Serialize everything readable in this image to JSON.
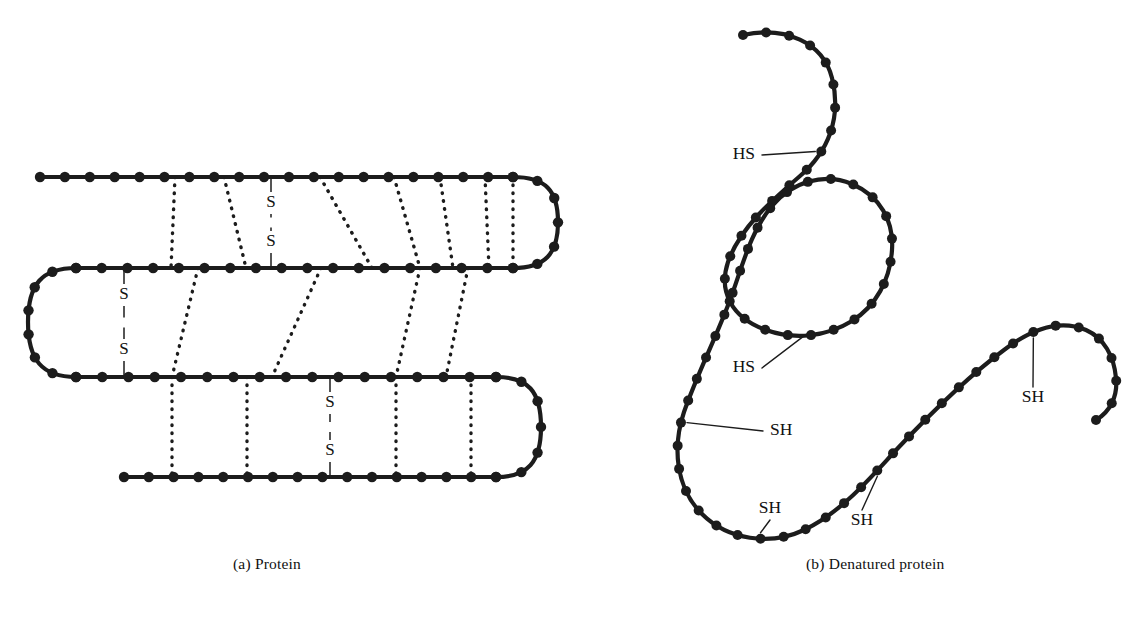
{
  "figure": {
    "background_color": "#ffffff",
    "ink_color": "#1c1c1c"
  },
  "panel_a": {
    "caption": "(a) Protein",
    "description": "Folded protein: beaded polypeptide backbone folded into four antiparallel strands joined by hairpin turns, cross-linked by dotted hydrogen bonds and three disulfide bridges.",
    "disulfide_label_top": "S",
    "disulfide_label_bottom": "S",
    "disulfide_bonds": [
      {
        "id": "ss-1",
        "x": 271,
        "y_top": 177,
        "y_bottom": 268
      },
      {
        "id": "ss-2",
        "x": 124,
        "y_top": 269,
        "y_bottom": 376
      },
      {
        "id": "ss-3",
        "x": 330,
        "y_top": 377,
        "y_bottom": 477
      }
    ],
    "strands": [
      {
        "id": "strand-1",
        "y": 177,
        "x_start": 40,
        "x_end": 513,
        "bead_count": 19
      },
      {
        "id": "strand-2",
        "y": 268,
        "x_start": 76,
        "x_end": 513,
        "bead_count": 17
      },
      {
        "id": "strand-3",
        "y": 377,
        "x_start": 76,
        "x_end": 496,
        "bead_count": 16
      },
      {
        "id": "strand-4",
        "y": 477,
        "x_start": 124,
        "x_end": 496,
        "bead_count": 14
      }
    ],
    "turns": [
      {
        "id": "turn-right-top",
        "side": "right",
        "cy": 222
      },
      {
        "id": "turn-left",
        "side": "left",
        "cy": 322
      },
      {
        "id": "turn-right-bottom",
        "side": "right",
        "cy": 427
      }
    ],
    "hydrogen_bond_count": 19
  },
  "panel_b": {
    "caption": "(b) Denatured protein",
    "description": "Denatured protein: the polypeptide chain is unfolded into an extended S-shaped strand with free sulfhydryl groups.",
    "thiol_labels": [
      {
        "id": "thiol-1",
        "text": "HS",
        "x": 755,
        "y": 155,
        "leader": "horizontal-right"
      },
      {
        "id": "thiol-2",
        "text": "HS",
        "x": 755,
        "y": 368,
        "leader": "horizontal-right"
      },
      {
        "id": "thiol-3",
        "text": "SH",
        "x": 770,
        "y": 431,
        "leader": "horizontal-left"
      },
      {
        "id": "thiol-4",
        "text": "SH",
        "x": 770,
        "y": 509,
        "leader": "vertical-down"
      },
      {
        "id": "thiol-5",
        "text": "SH",
        "x": 862,
        "y": 521,
        "leader": "vertical-up"
      },
      {
        "id": "thiol-6",
        "text": "SH",
        "x": 1033,
        "y": 398,
        "leader": "vertical-up"
      }
    ],
    "bead_count": 72
  }
}
